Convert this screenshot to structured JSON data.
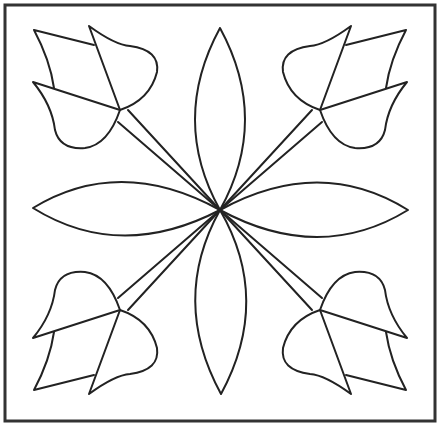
{
  "artwork": {
    "subject": "Tulip quilt block coloring pattern",
    "stroke_color": "#222222",
    "background": "#ffffff",
    "elements": [
      "border-frame",
      "center-petals",
      "tulip-top-left",
      "tulip-top-right",
      "tulip-bottom-left",
      "tulip-bottom-right"
    ]
  }
}
